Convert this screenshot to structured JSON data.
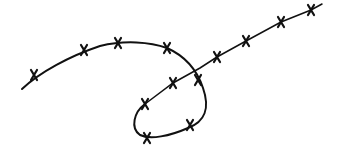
{
  "illustration": {
    "subject": "barbed-wire",
    "stroke_color": "#111111",
    "background": "#ffffff",
    "barbs_upper_arc": [
      [
        34,
        75
      ],
      [
        84,
        50
      ],
      [
        118,
        43
      ],
      [
        167,
        48
      ]
    ],
    "barbs_loop": [
      [
        198,
        80
      ],
      [
        190,
        125
      ],
      [
        147,
        138
      ],
      [
        145,
        104
      ]
    ],
    "barbs_line": [
      [
        173,
        83
      ],
      [
        217,
        57
      ],
      [
        246,
        41
      ],
      [
        281,
        22
      ],
      [
        311,
        10
      ]
    ]
  }
}
